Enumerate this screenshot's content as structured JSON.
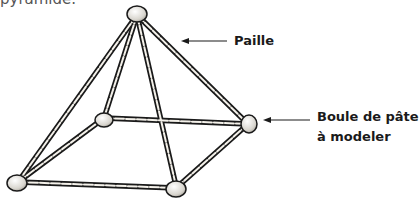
{
  "caption_fragment": "pyramide.",
  "labels": {
    "straw": "Paille",
    "clay_ball_line1": "Boule de pâte",
    "clay_ball_line2": "à modeler"
  },
  "colors": {
    "straw_outline": "#1a1a1a",
    "straw_fill": "#f4f1ea",
    "ball_fill": "#e8e6e0",
    "text": "#1a1a1a"
  }
}
